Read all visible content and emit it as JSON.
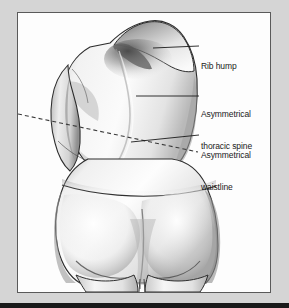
{
  "figure": {
    "panel": {
      "background_color": "#fdfdfd",
      "border_color": "#5a5a5a",
      "outer_background_color": "#d5d5d5",
      "bottom_band_color": "#1a1a1a"
    },
    "ink_color": "#1b1b1b"
  },
  "labels": [
    {
      "id": "rib-hump",
      "text": "Rib hump",
      "leader": {
        "x1": 152,
        "y1": 47,
        "x2": 197,
        "y2": 45,
        "style": "solid"
      }
    },
    {
      "id": "asymmetrical-thoracic-spine",
      "line1": "Asymmetrical",
      "line2": "thoracic spine",
      "leader": {
        "x1": 135,
        "y1": 95,
        "x2": 197,
        "y2": 95,
        "style": "solid"
      }
    },
    {
      "id": "asymmetrical-waistline",
      "line1": "Asymmetrical",
      "line2": "waistline",
      "leader": {
        "x1": 130,
        "y1": 141,
        "x2": 197,
        "y2": 134,
        "style": "solid"
      }
    }
  ],
  "annotations": {
    "waist_reference_line": {
      "name": "dashed-asymmetry-line",
      "style": "dashed",
      "x1": 17,
      "y1": 113,
      "x2": 196,
      "y2": 151
    }
  }
}
